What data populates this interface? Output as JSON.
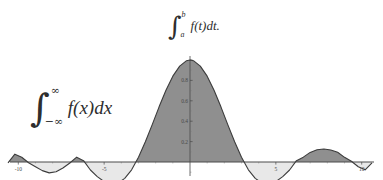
{
  "figure": {
    "background_color": "#ffffff",
    "annotations": [
      {
        "name": "definite-integral",
        "integral_symbol": "∫",
        "lower_limit": "a",
        "upper_limit": "b",
        "integrand": "f(t)dt.",
        "latex": "\\int_a^b f(t)dt."
      },
      {
        "name": "improper-integral",
        "integral_symbol": "∫",
        "lower_limit": "−∞",
        "upper_limit": "∞",
        "integrand": "f(x)dx",
        "latex": "\\int_{-\\infty}^{\\infty} f(x)dx"
      }
    ]
  },
  "chart_data": {
    "type": "area",
    "title": "",
    "xlabel": "",
    "ylabel": "",
    "xlim": [
      -10.6,
      10.6
    ],
    "ylim": [
      -0.28,
      1.05
    ],
    "grid": false,
    "legend": null,
    "function": "sinc-like: sin(x)/x",
    "axis_color": "#4a4a4a",
    "curve_color": "#3c3c3c",
    "positive_fill_color": "#8f8f8f",
    "negative_fill_color": "#e8e8e8",
    "x_ticks": [
      -10,
      -5,
      5,
      10
    ],
    "x_tick_labels": [
      "-10",
      "-5",
      "5",
      "10"
    ],
    "x_minor_ticks": [
      -9,
      -8,
      -7,
      -6,
      -4,
      -3,
      -2,
      -1,
      1,
      2,
      3,
      4,
      6,
      7,
      8,
      9
    ],
    "y_ticks": [
      0.2,
      0.4,
      0.6,
      0.8,
      1.0
    ],
    "y_tick_labels": [
      "0.2",
      "0.4",
      "0.6",
      "0.8",
      "1.0"
    ],
    "x": [
      -10.6,
      -10.2,
      -9.8,
      -9.4,
      -9.0,
      -8.6,
      -8.2,
      -7.8,
      -7.4,
      -7.0,
      -6.6,
      -6.2,
      -5.8,
      -5.4,
      -5.0,
      -4.6,
      -4.2,
      -3.8,
      -3.4,
      -3.0,
      -2.6,
      -2.2,
      -1.8,
      -1.4,
      -1.0,
      -0.6,
      -0.2,
      0.0,
      0.2,
      0.6,
      1.0,
      1.4,
      1.8,
      2.2,
      2.6,
      3.0,
      3.4,
      3.8,
      4.2,
      4.6,
      5.0,
      5.4,
      5.8,
      6.2,
      6.6,
      7.0,
      7.4,
      7.8,
      8.2,
      8.6,
      9.0,
      9.4,
      9.8,
      10.2,
      10.6
    ],
    "y": [
      -0.0087,
      0.0772,
      0.0471,
      -0.0078,
      -0.0458,
      -0.0847,
      -0.1065,
      -0.0954,
      -0.0583,
      -0.0094,
      0.0474,
      0.0128,
      -0.0786,
      -0.1437,
      -0.1918,
      -0.2158,
      -0.208,
      -0.1603,
      -0.0769,
      0.047,
      0.1983,
      0.3668,
      0.5409,
      0.7039,
      0.8415,
      0.9401,
      0.9933,
      1.0,
      0.9933,
      0.9401,
      0.8415,
      0.7039,
      0.5409,
      0.3668,
      0.1983,
      0.047,
      -0.0769,
      -0.1603,
      -0.208,
      -0.2158,
      -0.1918,
      -0.1437,
      -0.0786,
      0.0128,
      0.0474,
      0.0939,
      0.1196,
      0.1276,
      0.1183,
      0.0954,
      0.0458,
      0.0078,
      -0.0471,
      -0.0772,
      -0.0087
    ]
  }
}
